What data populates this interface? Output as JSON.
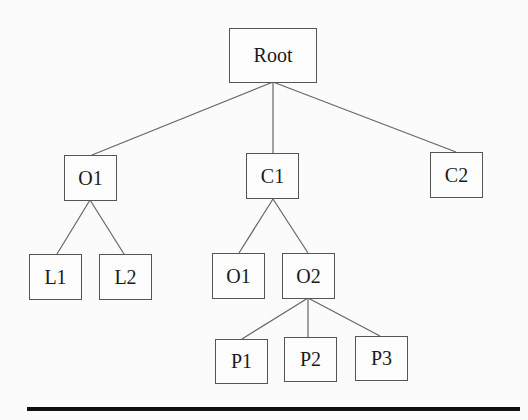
{
  "diagram": {
    "type": "tree",
    "nodes": [
      {
        "id": "root",
        "label": "Root",
        "x": 229,
        "y": 28,
        "w": 88,
        "h": 55
      },
      {
        "id": "o1a",
        "label": "O1",
        "x": 64,
        "y": 155,
        "w": 53,
        "h": 46
      },
      {
        "id": "c1",
        "label": "C1",
        "x": 246,
        "y": 153,
        "w": 53,
        "h": 46
      },
      {
        "id": "c2",
        "label": "C2",
        "x": 430,
        "y": 152,
        "w": 53,
        "h": 46
      },
      {
        "id": "l1",
        "label": "L1",
        "x": 29,
        "y": 254,
        "w": 53,
        "h": 46
      },
      {
        "id": "l2",
        "label": "L2",
        "x": 99,
        "y": 254,
        "w": 53,
        "h": 46
      },
      {
        "id": "o1b",
        "label": "O1",
        "x": 212,
        "y": 253,
        "w": 53,
        "h": 46
      },
      {
        "id": "o2",
        "label": "O2",
        "x": 282,
        "y": 253,
        "w": 53,
        "h": 46
      },
      {
        "id": "p1",
        "label": "P1",
        "x": 215,
        "y": 339,
        "w": 53,
        "h": 45
      },
      {
        "id": "p2",
        "label": "P2",
        "x": 284,
        "y": 337,
        "w": 53,
        "h": 45
      },
      {
        "id": "p3",
        "label": "P3",
        "x": 355,
        "y": 336,
        "w": 53,
        "h": 45
      }
    ],
    "edges": [
      {
        "from": "root",
        "to": "o1a",
        "x1": 273,
        "y1": 82,
        "x2": 92,
        "y2": 155
      },
      {
        "from": "root",
        "to": "c1",
        "x1": 273,
        "y1": 82,
        "x2": 273,
        "y2": 153
      },
      {
        "from": "root",
        "to": "c2",
        "x1": 273,
        "y1": 82,
        "x2": 456,
        "y2": 152
      },
      {
        "from": "o1a",
        "to": "l1",
        "x1": 90,
        "y1": 200,
        "x2": 57,
        "y2": 254
      },
      {
        "from": "o1a",
        "to": "l2",
        "x1": 90,
        "y1": 200,
        "x2": 124,
        "y2": 254
      },
      {
        "from": "c1",
        "to": "o1b",
        "x1": 273,
        "y1": 199,
        "x2": 239,
        "y2": 253
      },
      {
        "from": "c1",
        "to": "o2",
        "x1": 273,
        "y1": 199,
        "x2": 308,
        "y2": 253
      },
      {
        "from": "o2",
        "to": "p1",
        "x1": 308,
        "y1": 298,
        "x2": 242,
        "y2": 339
      },
      {
        "from": "o2",
        "to": "p2",
        "x1": 308,
        "y1": 298,
        "x2": 308,
        "y2": 337
      },
      {
        "from": "o2",
        "to": "p3",
        "x1": 308,
        "y1": 298,
        "x2": 380,
        "y2": 336
      }
    ],
    "colors": {
      "edge": "#666666",
      "border": "#555555",
      "text": "#1a1a1a",
      "rule": "#111111"
    }
  }
}
